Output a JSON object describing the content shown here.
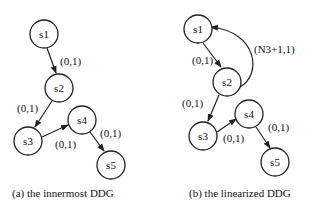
{
  "diagrams": [
    {
      "caption": "(a) the innermost DDG",
      "nodes": [
        {
          "id": "s1",
          "label": "s1"
        },
        {
          "id": "s2",
          "label": "s2"
        },
        {
          "id": "s3",
          "label": "s3"
        },
        {
          "id": "s4",
          "label": "s4"
        },
        {
          "id": "s5",
          "label": "s5"
        }
      ],
      "edges": [
        {
          "from": "s1",
          "to": "s2",
          "label": "(0,1)"
        },
        {
          "from": "s2",
          "to": "s3",
          "label": "(0,1)"
        },
        {
          "from": "s3",
          "to": "s4",
          "label": "(0,1)"
        },
        {
          "from": "s4",
          "to": "s5",
          "label": "(0,1)"
        }
      ]
    },
    {
      "caption": "(b) the linearized DDG",
      "nodes": [
        {
          "id": "s1",
          "label": "s1"
        },
        {
          "id": "s2",
          "label": "s2"
        },
        {
          "id": "s3",
          "label": "s3"
        },
        {
          "id": "s4",
          "label": "s4"
        },
        {
          "id": "s5",
          "label": "s5"
        }
      ],
      "edges": [
        {
          "from": "s1",
          "to": "s2",
          "label": "(0,1)"
        },
        {
          "from": "s2",
          "to": "s1",
          "label": "(N3+1,1)"
        },
        {
          "from": "s2",
          "to": "s3",
          "label": "(0,1)"
        },
        {
          "from": "s3",
          "to": "s4",
          "label": "(0,1)"
        },
        {
          "from": "s4",
          "to": "s5",
          "label": "(0,1)"
        }
      ]
    }
  ]
}
